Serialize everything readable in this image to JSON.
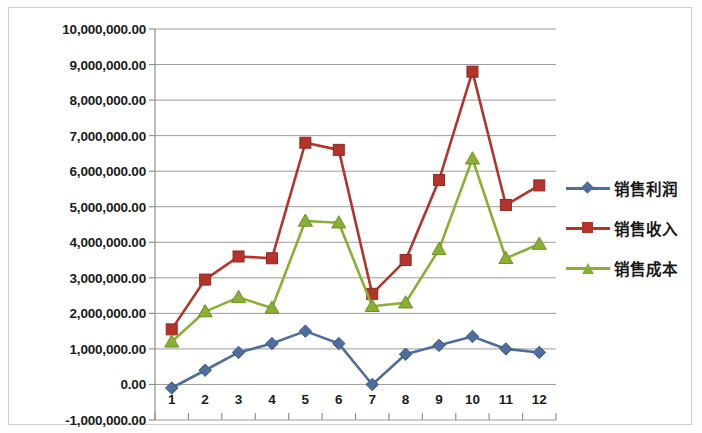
{
  "chart_data": {
    "type": "line",
    "title": "",
    "xlabel": "",
    "ylabel": "",
    "categories": [
      "1",
      "2",
      "3",
      "4",
      "5",
      "6",
      "7",
      "8",
      "9",
      "10",
      "11",
      "12"
    ],
    "ylim": [
      -1000000,
      10000000
    ],
    "ytick_values": [
      10000000,
      9000000,
      8000000,
      7000000,
      6000000,
      5000000,
      4000000,
      3000000,
      2000000,
      1000000,
      0,
      -1000000
    ],
    "ytick_labels": [
      "10,000,000.00",
      "9,000,000.00",
      "8,000,000.00",
      "7,000,000.00",
      "6,000,000.00",
      "5,000,000.00",
      "4,000,000.00",
      "3,000,000.00",
      "2,000,000.00",
      "1,000,000.00",
      "0.00",
      "-1,000,000.00"
    ],
    "grid": true,
    "legend_position": "right",
    "series": [
      {
        "name": "销售利润",
        "color": "#4f6d9e",
        "marker": "diamond",
        "values": [
          -100000,
          400000,
          900000,
          1150000,
          1500000,
          1150000,
          0,
          850000,
          1100000,
          1350000,
          1000000,
          900000
        ]
      },
      {
        "name": "销售收入",
        "color": "#b5332b",
        "marker": "square",
        "values": [
          1550000,
          2950000,
          3600000,
          3550000,
          6800000,
          6600000,
          2550000,
          3500000,
          5750000,
          8800000,
          5050000,
          5600000
        ]
      },
      {
        "name": "销售成本",
        "color": "#8ab033",
        "marker": "triangle",
        "values": [
          1200000,
          2050000,
          2450000,
          2150000,
          4600000,
          4550000,
          2200000,
          2300000,
          3800000,
          6350000,
          3550000,
          3950000
        ]
      }
    ]
  },
  "legend": {
    "items": [
      {
        "label": "销售利润"
      },
      {
        "label": "销售收入"
      },
      {
        "label": "销售成本"
      }
    ]
  }
}
